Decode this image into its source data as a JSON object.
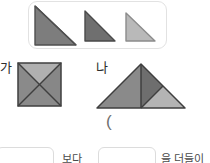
{
  "page": {
    "background_color": "#ffffff"
  },
  "reference_box": {
    "name": "triangle-reference-box",
    "border_color": "#e2e2e2",
    "shapes": [
      {
        "id": "triangle-large-dark",
        "kind": "right-triangle",
        "right_angle": "top-left",
        "width": 43,
        "height": 41,
        "fill": "#7d7d7d",
        "stroke": "#4f4f4f"
      },
      {
        "id": "triangle-medium-dark",
        "kind": "right-triangle",
        "right_angle": "top-left",
        "width": 32,
        "height": 31,
        "fill": "#6f6f6f",
        "stroke": "#4a4a4a"
      },
      {
        "id": "triangle-small-light",
        "kind": "right-triangle",
        "right_angle": "top-left",
        "width": 31,
        "height": 30,
        "fill": "#b9b9b9",
        "stroke": "#8c8c8c"
      }
    ]
  },
  "figures": [
    {
      "label": "가",
      "name": "figure-ga",
      "kind": "square-with-two-diagonals",
      "size": 45,
      "parts": [
        {
          "position": "top",
          "fill": "#b0b0b0"
        },
        {
          "position": "left",
          "fill": "#8a8a8a"
        },
        {
          "position": "right",
          "fill": "#878787"
        },
        {
          "position": "bottom",
          "fill": "#8a8a8a"
        }
      ],
      "stroke": "#3f3f3f"
    },
    {
      "label": "나",
      "name": "figure-na",
      "kind": "composite-triangle",
      "width": 88,
      "height": 46,
      "parts": [
        {
          "position": "left-large",
          "fill": "#8a8a8a"
        },
        {
          "position": "center-dark",
          "fill": "#6e6e6e"
        },
        {
          "position": "right-light",
          "fill": "#b4b4b4"
        }
      ],
      "stroke": "#3f3f3f"
    }
  ],
  "paren": {
    "text": "("
  },
  "answer_row": {
    "box_1_value": "",
    "box_1_placeholder": "",
    "separator_text": "보다",
    "box_2_value": "",
    "box_2_placeholder": "",
    "trailing_text": "을 더들이"
  }
}
